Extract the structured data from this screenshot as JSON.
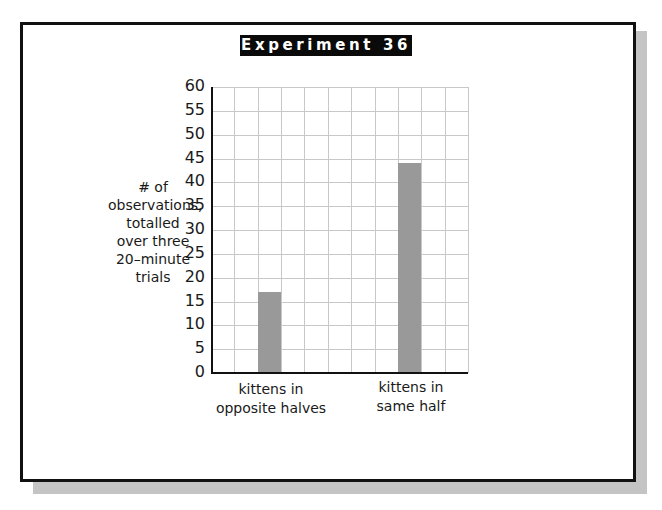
{
  "title": "Experiment 36",
  "chart_data": {
    "type": "bar",
    "title": "Experiment 36",
    "categories": [
      "kittens in opposite halves",
      "kittens in same half"
    ],
    "category_lines": [
      [
        "kittens in",
        "opposite halves"
      ],
      [
        "kittens in",
        "same half"
      ]
    ],
    "values": [
      17,
      44
    ],
    "xlabel": "",
    "ylabel": "# of observations, totalled over three 20-minute trials",
    "ylabel_lines": [
      "# of",
      "observations,",
      "totalled",
      "over three",
      "20–minute",
      "trials"
    ],
    "ylim": [
      0,
      60
    ],
    "yticks": [
      0,
      5,
      10,
      15,
      20,
      25,
      30,
      35,
      40,
      45,
      50,
      55,
      60
    ],
    "grid": true,
    "bar_color": "#999999",
    "legend": null
  }
}
